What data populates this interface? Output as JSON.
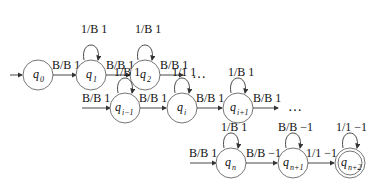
{
  "diagram": {
    "type": "turing-machine-state-diagram",
    "rows": [
      {
        "states": [
          {
            "id": "q0",
            "name": "q",
            "sub": "0",
            "start": true,
            "loop": null
          },
          {
            "id": "q1",
            "name": "q",
            "sub": "1",
            "loop": "1/B 1"
          },
          {
            "id": "q2",
            "name": "q",
            "sub": "2",
            "loop": "1/B 1"
          }
        ],
        "incoming": null,
        "transitions": [
          "B/B 1",
          "B/B 1",
          "B/B 1"
        ],
        "ellipsis": "…"
      },
      {
        "states": [
          {
            "id": "qi-1",
            "name": "q",
            "sub": "i−1",
            "loop": "1/B 1"
          },
          {
            "id": "qi",
            "name": "q",
            "sub": "i",
            "loop": "1/1 1"
          },
          {
            "id": "qi+1",
            "name": "q",
            "sub": "i+1",
            "loop": "1/B 1"
          }
        ],
        "incoming": "B/B 1",
        "transitions": [
          "B/B 1",
          "B/B 1",
          "B/B 1"
        ],
        "ellipsis": "…"
      },
      {
        "states": [
          {
            "id": "qn",
            "name": "q",
            "sub": "n",
            "loop": "1/B 1"
          },
          {
            "id": "qn+1",
            "name": "q",
            "sub": "n+1",
            "loop": "B/B −1"
          },
          {
            "id": "qn+2",
            "name": "q",
            "sub": "n+2",
            "loop": "1/1 −1",
            "accept": true
          }
        ],
        "incoming": "B/B 1",
        "transitions": [
          "B/B −1",
          "1/1 −1"
        ],
        "ellipsis": null
      }
    ]
  }
}
